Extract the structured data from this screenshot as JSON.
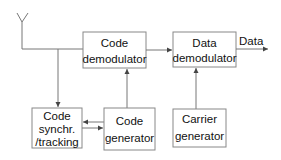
{
  "diagram": {
    "type": "block-diagram",
    "blocks": {
      "code_demodulator": {
        "line1": "Code",
        "line2": "demodulator"
      },
      "data_demodulator": {
        "line1": "Data",
        "line2": "demodulator"
      },
      "code_synch": {
        "line1": "Code",
        "line2": "synchr.",
        "line3": "/tracking"
      },
      "code_generator": {
        "line1": "Code",
        "line2": "generator"
      },
      "carrier_generator": {
        "line1": "Carrier",
        "line2": "generator"
      }
    },
    "output_label": "Data",
    "icons": {
      "antenna": "antenna-icon"
    },
    "colors": {
      "line": "#777777",
      "box_border": "#888888",
      "text": "#111111",
      "background": "#ffffff"
    },
    "connections": [
      {
        "from": "antenna",
        "to": "code_demodulator"
      },
      {
        "from": "antenna",
        "to": "code_synch"
      },
      {
        "from": "code_demodulator",
        "to": "data_demodulator"
      },
      {
        "from": "data_demodulator",
        "to": "output"
      },
      {
        "from": "code_generator",
        "to": "code_demodulator"
      },
      {
        "from": "carrier_generator",
        "to": "data_demodulator"
      },
      {
        "from": "code_generator",
        "to": "code_synch"
      },
      {
        "from": "code_synch",
        "to": "code_generator"
      }
    ]
  }
}
